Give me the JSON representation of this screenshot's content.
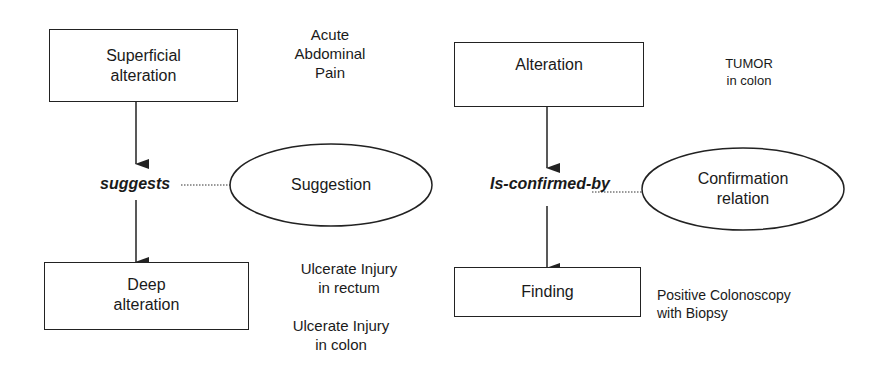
{
  "diagram": {
    "left": {
      "source_node": {
        "line1": "Superficial",
        "line2": "alteration"
      },
      "relation": "suggests",
      "relation_concept": "Suggestion",
      "target_node": {
        "line1": "Deep",
        "line2": "alteration"
      },
      "source_example": {
        "line1": "Acute",
        "line2": "Abdominal",
        "line3": "Pain"
      },
      "target_examples": [
        {
          "line1": "Ulcerate Injury",
          "line2": "in rectum"
        },
        {
          "line1": "Ulcerate Injury",
          "line2": "in colon"
        }
      ]
    },
    "right": {
      "source_node": {
        "line1": "Alteration"
      },
      "relation": "Is-confirmed-by",
      "relation_concept": {
        "line1": "Confirmation",
        "line2": "relation"
      },
      "target_node": {
        "line1": "Finding"
      },
      "source_example": {
        "line1": "TUMOR",
        "line2": "in colon"
      },
      "target_example": {
        "line1": "Positive Colonoscopy",
        "line2": "with Biopsy"
      }
    }
  },
  "colors": {
    "stroke": "#222222",
    "text": "#1a1a1a",
    "background": "#ffffff"
  }
}
